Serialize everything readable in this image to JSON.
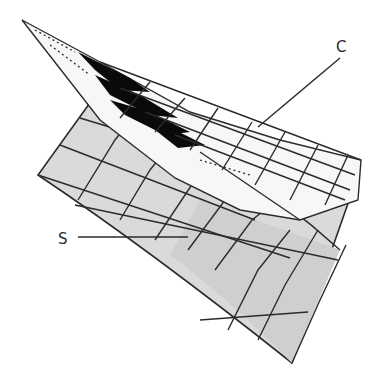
{
  "diagram": {
    "type": "3d-surface-illustration",
    "labels": [
      {
        "id": "C",
        "text": "C",
        "refers_to": "white mesh sheet (curve/patch) lying on surface",
        "anchor": [
          343,
          47
        ]
      },
      {
        "id": "S",
        "text": "S",
        "refers_to": "gray shaded surface",
        "anchor": [
          64,
          240
        ]
      }
    ],
    "colors": {
      "background": "#ffffff",
      "surface_fill": "#dcdcdc",
      "surface_fill_dark": "#cfcfcf",
      "sheet_fill": "#f7f7f7",
      "grid_line": "#2b2b2b",
      "shadow": "#0a0a0a"
    }
  },
  "labels": {
    "c": "C",
    "s": "S"
  }
}
